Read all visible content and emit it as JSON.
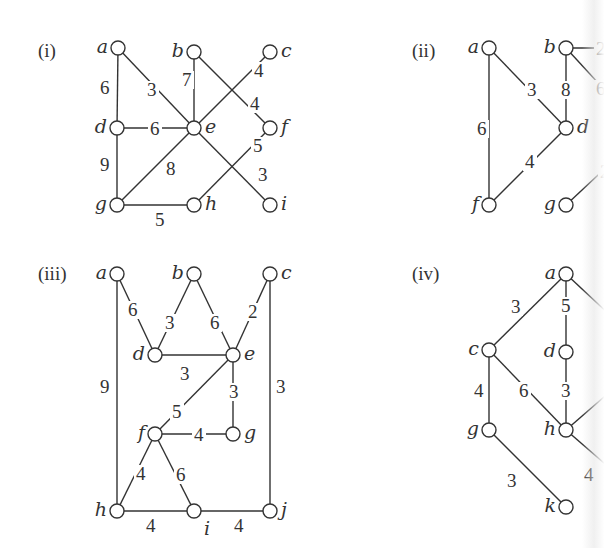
{
  "graphs": [
    {
      "id": "i",
      "title": "(i)",
      "nodes": [
        {
          "id": "a",
          "label": "a",
          "labelSide": "left"
        },
        {
          "id": "b",
          "label": "b",
          "labelSide": "left"
        },
        {
          "id": "c",
          "label": "c",
          "labelSide": "right"
        },
        {
          "id": "d",
          "label": "d",
          "labelSide": "left"
        },
        {
          "id": "e",
          "label": "e",
          "labelSide": "right"
        },
        {
          "id": "f",
          "label": "f",
          "labelSide": "right"
        },
        {
          "id": "g",
          "label": "g",
          "labelSide": "left"
        },
        {
          "id": "h",
          "label": "h",
          "labelSide": "right"
        },
        {
          "id": "i",
          "label": "i",
          "labelSide": "right"
        }
      ],
      "edges": [
        {
          "from": "a",
          "to": "d",
          "weight": "6"
        },
        {
          "from": "a",
          "to": "e",
          "weight": "3"
        },
        {
          "from": "b",
          "to": "e",
          "weight": "7"
        },
        {
          "from": "b",
          "to": "f",
          "weight": "4"
        },
        {
          "from": "e",
          "to": "c",
          "weight": "4"
        },
        {
          "from": "d",
          "to": "e",
          "weight": "6"
        },
        {
          "from": "d",
          "to": "g",
          "weight": "9"
        },
        {
          "from": "g",
          "to": "e",
          "weight": "8"
        },
        {
          "from": "g",
          "to": "h",
          "weight": "5"
        },
        {
          "from": "h",
          "to": "f",
          "weight": "5"
        },
        {
          "from": "e",
          "to": "i",
          "weight": "3"
        }
      ]
    },
    {
      "id": "ii",
      "title": "(ii)",
      "nodes": [
        {
          "id": "a",
          "label": "a",
          "labelSide": "left"
        },
        {
          "id": "b",
          "label": "b",
          "labelSide": "left"
        },
        {
          "id": "d",
          "label": "d",
          "labelSide": "right"
        },
        {
          "id": "f",
          "label": "f",
          "labelSide": "left"
        },
        {
          "id": "g",
          "label": "g",
          "labelSide": "left"
        }
      ],
      "edges": [
        {
          "from": "a",
          "to": "d",
          "weight": "3"
        },
        {
          "from": "a",
          "to": "f",
          "weight": "6"
        },
        {
          "from": "b",
          "to": "d",
          "weight": "8"
        },
        {
          "from": "f",
          "to": "d",
          "weight": "4"
        },
        {
          "from": "b",
          "to": "offright1",
          "weight": "2"
        },
        {
          "from": "b",
          "to": "offright2",
          "weight": "6"
        },
        {
          "from": "g",
          "to": "offright3",
          "weight": "2"
        }
      ]
    },
    {
      "id": "iii",
      "title": "(iii)",
      "nodes": [
        {
          "id": "a",
          "label": "a",
          "labelSide": "left"
        },
        {
          "id": "b",
          "label": "b",
          "labelSide": "left"
        },
        {
          "id": "c",
          "label": "c",
          "labelSide": "right"
        },
        {
          "id": "d",
          "label": "d",
          "labelSide": "left"
        },
        {
          "id": "e",
          "label": "e",
          "labelSide": "right"
        },
        {
          "id": "f",
          "label": "f",
          "labelSide": "left"
        },
        {
          "id": "g",
          "label": "g",
          "labelSide": "right"
        },
        {
          "id": "h",
          "label": "h",
          "labelSide": "left"
        },
        {
          "id": "i",
          "label": "i",
          "labelSide": "below"
        },
        {
          "id": "j",
          "label": "j",
          "labelSide": "right"
        }
      ],
      "edges": [
        {
          "from": "a",
          "to": "d",
          "weight": "6"
        },
        {
          "from": "a",
          "to": "h",
          "weight": "9"
        },
        {
          "from": "b",
          "to": "d",
          "weight": "3"
        },
        {
          "from": "b",
          "to": "e",
          "weight": "6"
        },
        {
          "from": "c",
          "to": "e",
          "weight": "2"
        },
        {
          "from": "c",
          "to": "j",
          "weight": "3"
        },
        {
          "from": "d",
          "to": "e",
          "weight": "3"
        },
        {
          "from": "e",
          "to": "f",
          "weight": "5"
        },
        {
          "from": "e",
          "to": "g",
          "weight": "3"
        },
        {
          "from": "f",
          "to": "g",
          "weight": "4"
        },
        {
          "from": "f",
          "to": "h",
          "weight": "4"
        },
        {
          "from": "f",
          "to": "i",
          "weight": "6"
        },
        {
          "from": "h",
          "to": "i",
          "weight": "4"
        },
        {
          "from": "i",
          "to": "j",
          "weight": "4"
        }
      ]
    },
    {
      "id": "iv",
      "title": "(iv)",
      "nodes": [
        {
          "id": "a",
          "label": "a",
          "labelSide": "left"
        },
        {
          "id": "c",
          "label": "c",
          "labelSide": "left"
        },
        {
          "id": "d",
          "label": "d",
          "labelSide": "left"
        },
        {
          "id": "g",
          "label": "g",
          "labelSide": "left"
        },
        {
          "id": "h",
          "label": "h",
          "labelSide": "left"
        },
        {
          "id": "k",
          "label": "k",
          "labelSide": "left"
        }
      ],
      "edges": [
        {
          "from": "a",
          "to": "c",
          "weight": "3"
        },
        {
          "from": "a",
          "to": "d",
          "weight": "5"
        },
        {
          "from": "c",
          "to": "g",
          "weight": "4"
        },
        {
          "from": "c",
          "to": "h",
          "weight": "6"
        },
        {
          "from": "d",
          "to": "h",
          "weight": "3"
        },
        {
          "from": "g",
          "to": "k",
          "weight": "3"
        },
        {
          "from": "a",
          "to": "offright1",
          "weight": ""
        },
        {
          "from": "h",
          "to": "offright2",
          "weight": ""
        },
        {
          "from": "h",
          "to": "offright3",
          "weight": "4"
        }
      ]
    }
  ]
}
